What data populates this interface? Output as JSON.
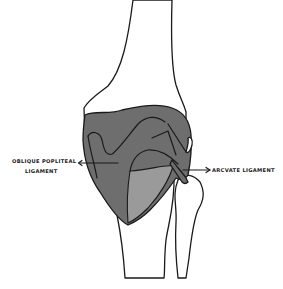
{
  "diagram": {
    "labels": {
      "oblique_popliteal_line1": "OBLIQUE POPLITEAL",
      "oblique_popliteal_line2": "LIGAMENT",
      "arcuate": "ARCVATE LIGAMENT"
    },
    "colors": {
      "background": "#ffffff",
      "bone": "#ffffff",
      "outline": "#1a1a1a",
      "capsule_dark": "#6e6e6e",
      "capsule_light": "#9a9a9a"
    }
  }
}
